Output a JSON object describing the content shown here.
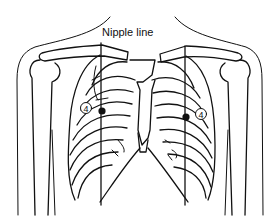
{
  "figure": {
    "title": "Nipple line",
    "markers": [
      {
        "label": "4",
        "side": "left"
      },
      {
        "label": "4",
        "side": "right"
      }
    ],
    "colors": {
      "line": "#111111",
      "background": "#ffffff"
    }
  }
}
